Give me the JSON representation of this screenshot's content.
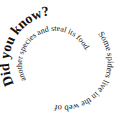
{
  "graphic": {
    "heading": "Did you know?",
    "fact_part1": "Some spiders live in the web of",
    "fact_part2": "another species and steal its food.",
    "text_color": "#111111",
    "background": "#ffffff"
  }
}
